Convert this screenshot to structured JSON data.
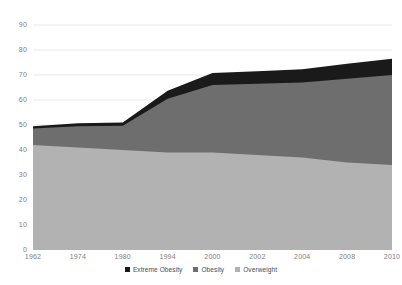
{
  "chart_data": {
    "type": "area",
    "title": "",
    "xlabel": "",
    "ylabel": "",
    "ylim": [
      0,
      90
    ],
    "ytick_step": 10,
    "grid": true,
    "stacked": true,
    "legend_position": "bottom",
    "categories": [
      "1962",
      "1974",
      "1980",
      "1994",
      "2000",
      "2002",
      "2004",
      "2008",
      "2010"
    ],
    "yticks": [
      "0",
      "10",
      "20",
      "30",
      "40",
      "50",
      "60",
      "70",
      "80",
      "90"
    ],
    "series": [
      {
        "name": "Overweight",
        "color": "#b2b2b2",
        "values": [
          42,
          41,
          40,
          39,
          39,
          38,
          37,
          35,
          34
        ]
      },
      {
        "name": "Obesity",
        "color": "#6e6e6e",
        "values": [
          6.6,
          8.5,
          9.7,
          21.5,
          27,
          28.5,
          30,
          33.5,
          36
        ]
      },
      {
        "name": "Extreme Obesity",
        "color": "#1a1a1a",
        "values": [
          0.9,
          1.2,
          1.3,
          3.2,
          4.8,
          5,
          5.3,
          6,
          6.5
        ]
      }
    ],
    "totals": [
      49.5,
      50.7,
      51,
      63.7,
      70.8,
      71.5,
      72.3,
      74.5,
      76.5
    ]
  },
  "legend": {
    "items": [
      {
        "label": "Extreme Obesity",
        "color": "#1a1a1a"
      },
      {
        "label": "Obesity",
        "color": "#6e6e6e"
      },
      {
        "label": "Overweight",
        "color": "#b2b2b2"
      }
    ]
  }
}
